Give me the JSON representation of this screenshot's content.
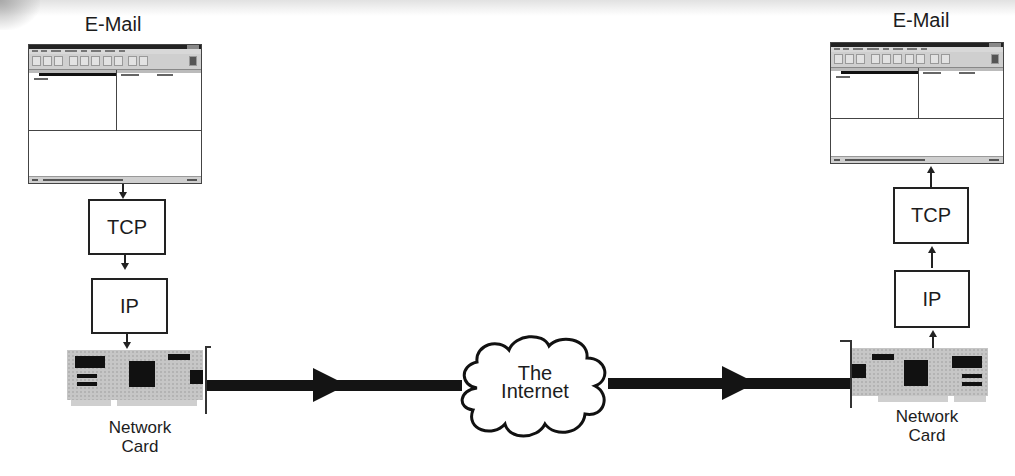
{
  "diagram": {
    "type": "network-stack-flow",
    "sender": {
      "app_label": "E-Mail",
      "layers": [
        "TCP",
        "IP"
      ],
      "hardware_label_line1": "Network",
      "hardware_label_line2": "Card",
      "direction": "down"
    },
    "network": {
      "label_line1": "The",
      "label_line2": "Internet",
      "shape": "cloud",
      "flow_direction": "left-to-right"
    },
    "receiver": {
      "app_label": "E-Mail",
      "layers": [
        "TCP",
        "IP"
      ],
      "hardware_label_line1": "Network",
      "hardware_label_line2": "Card",
      "direction": "up"
    },
    "colors": {
      "line": "#141414",
      "box_border": "#222222",
      "card": "#c6c6c6",
      "background": "#ffffff"
    }
  }
}
